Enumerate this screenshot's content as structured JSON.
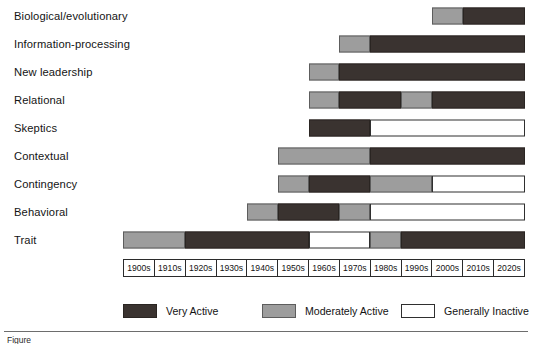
{
  "chart_data": {
    "type": "bar",
    "title": "",
    "subtitle": "",
    "xlabel": "",
    "ylabel": "",
    "orientation": "horizontal-timeline",
    "grid": false,
    "legend_position": "bottom",
    "x_axis": {
      "type": "category",
      "tick_labels": [
        "1900s",
        "1910s",
        "1920s",
        "1930s",
        "1940s",
        "1950s",
        "1960s",
        "1970s",
        "1980s",
        "1990s",
        "2000s",
        "2010s",
        "2020s"
      ]
    },
    "activity_levels": [
      {
        "key": "very",
        "label": "Very Active",
        "color": "#3a3330"
      },
      {
        "key": "mod",
        "label": "Moderately Active",
        "color": "#9d9d9d"
      },
      {
        "key": "inactive",
        "label": "Generally Inactive",
        "color": "#ffffff"
      }
    ],
    "categories": [
      "Biological/evolutionary",
      "Information-processing",
      "New leadership",
      "Relational",
      "Skeptics",
      "Contextual",
      "Contingency",
      "Behavioral",
      "Trait"
    ],
    "series": [
      {
        "name": "Biological/evolutionary",
        "segments": [
          {
            "level": "mod",
            "start_decade": "2000s",
            "end_decade": "2000s",
            "start_index": 10,
            "end_index": 11
          },
          {
            "level": "very",
            "start_decade": "2010s",
            "end_decade": "2020s",
            "start_index": 11,
            "end_index": 13
          }
        ]
      },
      {
        "name": "Information-processing",
        "segments": [
          {
            "level": "mod",
            "start_decade": "1970s",
            "end_decade": "1970s",
            "start_index": 7,
            "end_index": 8
          },
          {
            "level": "very",
            "start_decade": "1980s",
            "end_decade": "2020s",
            "start_index": 8,
            "end_index": 13
          }
        ]
      },
      {
        "name": "New leadership",
        "segments": [
          {
            "level": "mod",
            "start_decade": "1960s",
            "end_decade": "1960s",
            "start_index": 6,
            "end_index": 7
          },
          {
            "level": "very",
            "start_decade": "1970s",
            "end_decade": "2020s",
            "start_index": 7,
            "end_index": 13
          }
        ]
      },
      {
        "name": "Relational",
        "segments": [
          {
            "level": "mod",
            "start_decade": "1960s",
            "end_decade": "1960s",
            "start_index": 6,
            "end_index": 7
          },
          {
            "level": "very",
            "start_decade": "1970s",
            "end_decade": "1980s",
            "start_index": 7,
            "end_index": 9
          },
          {
            "level": "mod",
            "start_decade": "1990s",
            "end_decade": "1990s",
            "start_index": 9,
            "end_index": 10
          },
          {
            "level": "very",
            "start_decade": "2000s",
            "end_decade": "2020s",
            "start_index": 10,
            "end_index": 13
          }
        ]
      },
      {
        "name": "Skeptics",
        "segments": [
          {
            "level": "very",
            "start_decade": "1960s",
            "end_decade": "1970s",
            "start_index": 6,
            "end_index": 8
          },
          {
            "level": "inactive",
            "start_decade": "1980s",
            "end_decade": "2020s",
            "start_index": 8,
            "end_index": 13
          }
        ]
      },
      {
        "name": "Contextual",
        "segments": [
          {
            "level": "mod",
            "start_decade": "1950s",
            "end_decade": "1970s",
            "start_index": 5,
            "end_index": 8
          },
          {
            "level": "very",
            "start_decade": "1980s",
            "end_decade": "2020s",
            "start_index": 8,
            "end_index": 13
          }
        ]
      },
      {
        "name": "Contingency",
        "segments": [
          {
            "level": "mod",
            "start_decade": "1950s",
            "end_decade": "1950s",
            "start_index": 5,
            "end_index": 6
          },
          {
            "level": "very",
            "start_decade": "1960s",
            "end_decade": "1970s",
            "start_index": 6,
            "end_index": 8
          },
          {
            "level": "mod",
            "start_decade": "1980s",
            "end_decade": "1990s",
            "start_index": 8,
            "end_index": 10
          },
          {
            "level": "inactive",
            "start_decade": "2000s",
            "end_decade": "2020s",
            "start_index": 10,
            "end_index": 13
          }
        ]
      },
      {
        "name": "Behavioral",
        "segments": [
          {
            "level": "mod",
            "start_decade": "1940s",
            "end_decade": "1940s",
            "start_index": 4,
            "end_index": 5
          },
          {
            "level": "very",
            "start_decade": "1950s",
            "end_decade": "1960s",
            "start_index": 5,
            "end_index": 7
          },
          {
            "level": "mod",
            "start_decade": "1970s",
            "end_decade": "1970s",
            "start_index": 7,
            "end_index": 8
          },
          {
            "level": "inactive",
            "start_decade": "1980s",
            "end_decade": "2020s",
            "start_index": 8,
            "end_index": 13
          }
        ]
      },
      {
        "name": "Trait",
        "segments": [
          {
            "level": "mod",
            "start_decade": "1900s",
            "end_decade": "1910s",
            "start_index": 0,
            "end_index": 2
          },
          {
            "level": "very",
            "start_decade": "1920s",
            "end_decade": "1950s",
            "start_index": 2,
            "end_index": 6
          },
          {
            "level": "inactive",
            "start_decade": "1960s",
            "end_decade": "1970s",
            "start_index": 6,
            "end_index": 8
          },
          {
            "level": "mod",
            "start_decade": "1980s",
            "end_decade": "1980s",
            "start_index": 8,
            "end_index": 9
          },
          {
            "level": "very",
            "start_decade": "1990s",
            "end_decade": "2020s",
            "start_index": 9,
            "end_index": 13
          }
        ]
      }
    ]
  },
  "figure": {
    "caption": "Figure"
  }
}
